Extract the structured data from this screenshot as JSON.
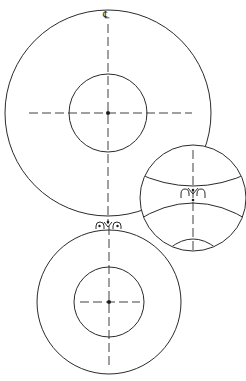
{
  "diagram": {
    "centerline_label": "℄",
    "colors": {
      "stroke": "#2a2a2a",
      "background": "#ffffff"
    },
    "upper_roll": {
      "outer": {
        "cx": 108,
        "cy": 113,
        "r": 103
      },
      "inner": {
        "cx": 108,
        "cy": 113,
        "r": 39
      }
    },
    "lower_roll": {
      "outer": {
        "cx": 109,
        "cy": 302,
        "r": 72
      },
      "inner": {
        "cx": 109,
        "cy": 302,
        "r": 35
      }
    },
    "detail_inset": {
      "cx": 193,
      "cy": 198,
      "r": 53
    },
    "nozzle": {
      "x": 108,
      "y": 222
    }
  }
}
